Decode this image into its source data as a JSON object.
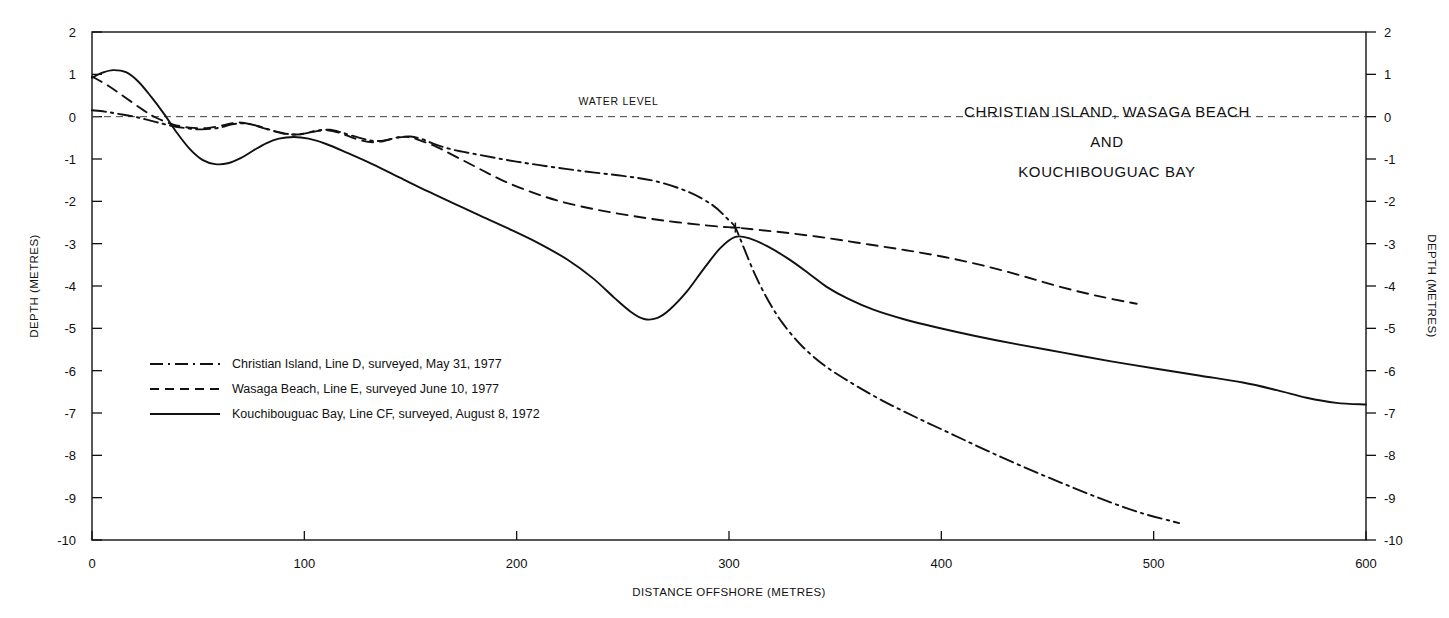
{
  "chart_data": {
    "type": "line",
    "title": [
      "CHRISTIAN ISLAND, WASAGA BEACH",
      "AND",
      "KOUCHIBOUGUAC BAY"
    ],
    "xlabel": "DISTANCE OFFSHORE (METRES)",
    "ylabel": "DEPTH (METRES)",
    "ylabel_right": "DEPTH (METRES)",
    "xlim": [
      0,
      600
    ],
    "ylim": [
      -10,
      2
    ],
    "xticks": [
      0,
      100,
      200,
      300,
      400,
      500,
      600
    ],
    "xtick_labels": [
      "0",
      "100",
      "200",
      "300",
      "400",
      "500",
      "600"
    ],
    "yticks": [
      2,
      1,
      0,
      -1,
      -2,
      -3,
      -4,
      -5,
      -6,
      -7,
      -8,
      -9,
      -10
    ],
    "ytick_labels": [
      "2",
      "1",
      "0",
      "-1",
      "-2",
      "-3",
      "-4",
      "-5",
      "-6",
      "-7",
      "-8",
      "-9",
      "-10"
    ],
    "grid": false,
    "legend_position": "inside-lower-left",
    "annotations": [
      {
        "name": "water-level",
        "text": "WATER LEVEL",
        "x": 248,
        "y": 0.28
      },
      {
        "name": "convergence-marker",
        "text": "+",
        "x": 303,
        "y": -2.62
      }
    ],
    "reference_lines": [
      {
        "name": "water-level-line",
        "y": 0,
        "style": "dashed",
        "x_from": 0,
        "x_to": 600
      }
    ],
    "series": [
      {
        "name": "Christian Island, Line D, surveyed, May 31, 1977",
        "style": "dashdot",
        "color": "#111111",
        "points": [
          [
            0,
            0.15
          ],
          [
            6,
            0.12
          ],
          [
            12,
            0.07
          ],
          [
            20,
            0.0
          ],
          [
            28,
            -0.1
          ],
          [
            36,
            -0.2
          ],
          [
            44,
            -0.27
          ],
          [
            52,
            -0.3
          ],
          [
            60,
            -0.26
          ],
          [
            66,
            -0.18
          ],
          [
            72,
            -0.16
          ],
          [
            78,
            -0.22
          ],
          [
            86,
            -0.34
          ],
          [
            94,
            -0.42
          ],
          [
            100,
            -0.4
          ],
          [
            106,
            -0.33
          ],
          [
            112,
            -0.31
          ],
          [
            118,
            -0.38
          ],
          [
            126,
            -0.5
          ],
          [
            132,
            -0.57
          ],
          [
            138,
            -0.56
          ],
          [
            144,
            -0.49
          ],
          [
            150,
            -0.47
          ],
          [
            156,
            -0.54
          ],
          [
            162,
            -0.66
          ],
          [
            170,
            -0.78
          ],
          [
            180,
            -0.88
          ],
          [
            195,
            -1.02
          ],
          [
            210,
            -1.14
          ],
          [
            230,
            -1.28
          ],
          [
            250,
            -1.4
          ],
          [
            265,
            -1.52
          ],
          [
            280,
            -1.76
          ],
          [
            292,
            -2.08
          ],
          [
            300,
            -2.45
          ],
          [
            303,
            -2.62
          ],
          [
            307,
            -3.1
          ],
          [
            312,
            -3.7
          ],
          [
            318,
            -4.3
          ],
          [
            325,
            -4.86
          ],
          [
            334,
            -5.4
          ],
          [
            345,
            -5.88
          ],
          [
            358,
            -6.3
          ],
          [
            372,
            -6.7
          ],
          [
            388,
            -7.1
          ],
          [
            405,
            -7.5
          ],
          [
            422,
            -7.9
          ],
          [
            440,
            -8.3
          ],
          [
            458,
            -8.68
          ],
          [
            476,
            -9.04
          ],
          [
            494,
            -9.36
          ],
          [
            512,
            -9.6
          ]
        ]
      },
      {
        "name": "Wasaga Beach, Line E, surveyed June 10, 1977",
        "style": "dashed",
        "color": "#111111",
        "points": [
          [
            0,
            0.95
          ],
          [
            8,
            0.72
          ],
          [
            16,
            0.44
          ],
          [
            24,
            0.16
          ],
          [
            30,
            -0.02
          ],
          [
            38,
            -0.18
          ],
          [
            46,
            -0.26
          ],
          [
            54,
            -0.27
          ],
          [
            62,
            -0.2
          ],
          [
            68,
            -0.14
          ],
          [
            74,
            -0.17
          ],
          [
            82,
            -0.29
          ],
          [
            90,
            -0.4
          ],
          [
            97,
            -0.42
          ],
          [
            104,
            -0.36
          ],
          [
            110,
            -0.32
          ],
          [
            117,
            -0.39
          ],
          [
            124,
            -0.52
          ],
          [
            131,
            -0.6
          ],
          [
            137,
            -0.58
          ],
          [
            143,
            -0.5
          ],
          [
            149,
            -0.48
          ],
          [
            155,
            -0.57
          ],
          [
            163,
            -0.73
          ],
          [
            172,
            -0.96
          ],
          [
            182,
            -1.22
          ],
          [
            194,
            -1.52
          ],
          [
            208,
            -1.8
          ],
          [
            222,
            -2.02
          ],
          [
            238,
            -2.2
          ],
          [
            254,
            -2.34
          ],
          [
            270,
            -2.46
          ],
          [
            286,
            -2.55
          ],
          [
            296,
            -2.6
          ],
          [
            303,
            -2.62
          ],
          [
            315,
            -2.68
          ],
          [
            330,
            -2.76
          ],
          [
            348,
            -2.88
          ],
          [
            366,
            -3.02
          ],
          [
            384,
            -3.16
          ],
          [
            402,
            -3.32
          ],
          [
            420,
            -3.52
          ],
          [
            438,
            -3.76
          ],
          [
            456,
            -4.02
          ],
          [
            474,
            -4.24
          ],
          [
            492,
            -4.42
          ]
        ]
      },
      {
        "name": "Kouchibouguac Bay, Line CF, surveyed, August 8, 1972",
        "style": "solid",
        "color": "#111111",
        "points": [
          [
            0,
            0.92
          ],
          [
            5,
            1.04
          ],
          [
            10,
            1.1
          ],
          [
            16,
            1.05
          ],
          [
            22,
            0.82
          ],
          [
            28,
            0.46
          ],
          [
            34,
            0.06
          ],
          [
            40,
            -0.38
          ],
          [
            46,
            -0.76
          ],
          [
            52,
            -1.02
          ],
          [
            58,
            -1.12
          ],
          [
            64,
            -1.1
          ],
          [
            70,
            -0.98
          ],
          [
            76,
            -0.8
          ],
          [
            82,
            -0.63
          ],
          [
            88,
            -0.52
          ],
          [
            95,
            -0.48
          ],
          [
            102,
            -0.52
          ],
          [
            110,
            -0.64
          ],
          [
            120,
            -0.85
          ],
          [
            132,
            -1.12
          ],
          [
            145,
            -1.44
          ],
          [
            158,
            -1.76
          ],
          [
            170,
            -2.04
          ],
          [
            182,
            -2.32
          ],
          [
            196,
            -2.64
          ],
          [
            210,
            -2.98
          ],
          [
            224,
            -3.38
          ],
          [
            236,
            -3.82
          ],
          [
            246,
            -4.28
          ],
          [
            254,
            -4.62
          ],
          [
            260,
            -4.78
          ],
          [
            266,
            -4.76
          ],
          [
            272,
            -4.56
          ],
          [
            280,
            -4.14
          ],
          [
            288,
            -3.6
          ],
          [
            296,
            -3.1
          ],
          [
            303,
            -2.84
          ],
          [
            310,
            -2.88
          ],
          [
            318,
            -3.06
          ],
          [
            328,
            -3.36
          ],
          [
            338,
            -3.72
          ],
          [
            346,
            -4.02
          ],
          [
            356,
            -4.3
          ],
          [
            368,
            -4.56
          ],
          [
            382,
            -4.78
          ],
          [
            398,
            -4.98
          ],
          [
            416,
            -5.18
          ],
          [
            436,
            -5.38
          ],
          [
            458,
            -5.58
          ],
          [
            480,
            -5.78
          ],
          [
            502,
            -5.96
          ],
          [
            522,
            -6.12
          ],
          [
            542,
            -6.28
          ],
          [
            558,
            -6.46
          ],
          [
            572,
            -6.64
          ],
          [
            586,
            -6.76
          ],
          [
            600,
            -6.8
          ]
        ]
      }
    ],
    "legend_entries": [
      {
        "label": "Christian Island, Line D, surveyed, May 31, 1977",
        "style": "dashdot"
      },
      {
        "label": "Wasaga Beach, Line E, surveyed June 10, 1977",
        "style": "dashed"
      },
      {
        "label": "Kouchibouguac Bay, Line CF, surveyed, August 8, 1972",
        "style": "solid"
      }
    ]
  }
}
